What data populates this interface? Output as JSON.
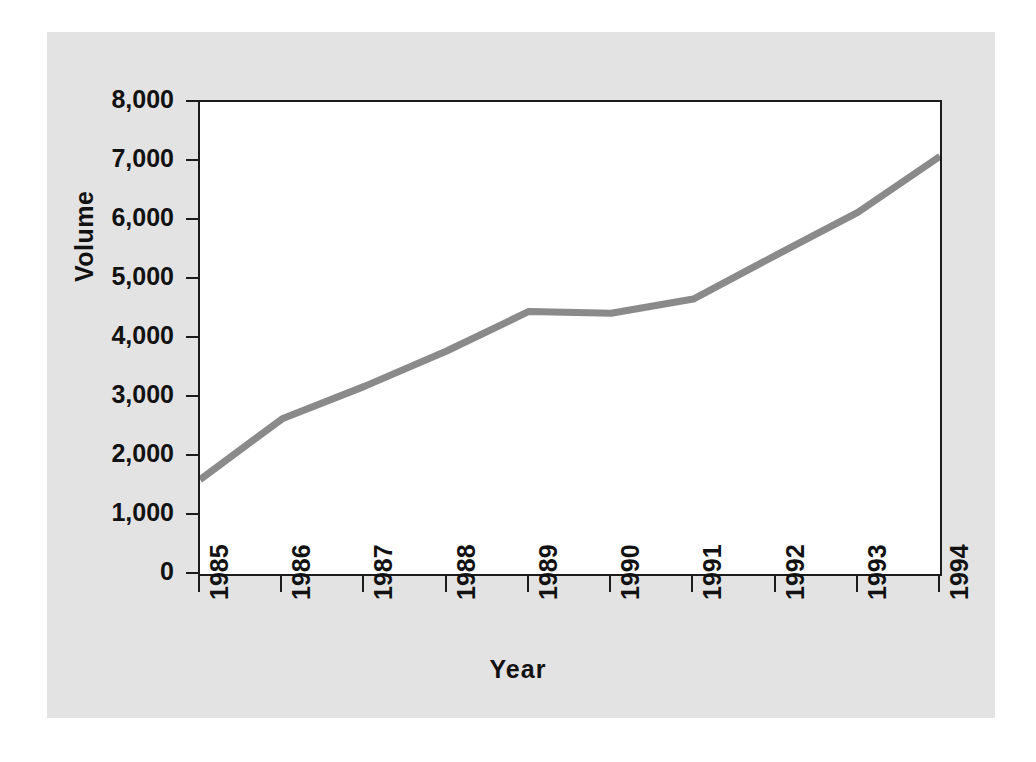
{
  "figure": {
    "background_color": "#ffffff",
    "panel_color": "#e3e3e3",
    "plot_background_color": "#ffffff",
    "axis_color": "#1c1c1c",
    "line_color": "#8a8a8a"
  },
  "chart_data": {
    "type": "line",
    "title": "",
    "subtitle": "",
    "xlabel": "Year",
    "ylabel": "Volume",
    "x": [
      1985,
      1986,
      1987,
      1988,
      1989,
      1990,
      1991,
      1992,
      1993,
      1994
    ],
    "categories": [
      "1985",
      "1986",
      "1987",
      "1988",
      "1989",
      "1990",
      "1991",
      "1992",
      "1993",
      "1994"
    ],
    "values": [
      1600,
      2630,
      3180,
      3780,
      4450,
      4420,
      4660,
      5400,
      6130,
      7080
    ],
    "series": [
      {
        "name": "Volume",
        "color": "#8a8a8a",
        "values": [
          1600,
          2630,
          3180,
          3780,
          4450,
          4420,
          4660,
          5400,
          6130,
          7080
        ]
      }
    ],
    "xlim": [
      1985,
      1994
    ],
    "ylim": [
      0,
      8000
    ],
    "ytick_labels": [
      "8,000",
      "7,000",
      "6,000",
      "5,000",
      "4,000",
      "3,000",
      "2,000",
      "1,000",
      "0"
    ],
    "ytick_values": [
      8000,
      7000,
      6000,
      5000,
      4000,
      3000,
      2000,
      1000,
      0
    ],
    "xtick_labels": [
      "1985",
      "1986",
      "1987",
      "1988",
      "1989",
      "1990",
      "1991",
      "1992",
      "1993",
      "1994"
    ],
    "grid": false,
    "legend": false,
    "legend_position": "none",
    "xtick_label_rotation": 90,
    "ylabel_rotation": 90,
    "annotations": []
  }
}
